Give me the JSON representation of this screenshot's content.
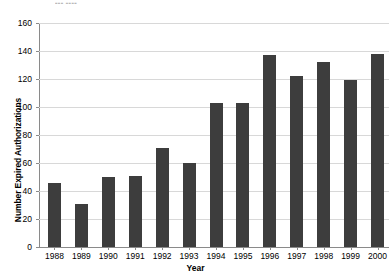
{
  "chart_data": {
    "type": "bar",
    "title": "",
    "title_remnant": "▪▪▪ ▪▪▪▪",
    "xlabel": "Year",
    "ylabel": "Number Expired Authorizations",
    "categories": [
      "1988",
      "1989",
      "1990",
      "1991",
      "1992",
      "1993",
      "1994",
      "1995",
      "1996",
      "1997",
      "1998",
      "1999",
      "2000"
    ],
    "values": [
      46,
      31,
      50,
      51,
      71,
      60,
      103,
      103,
      137,
      122,
      132,
      119,
      138
    ],
    "series": [
      {
        "name": "Number Expired Authorizations",
        "values": [
          46,
          31,
          50,
          51,
          71,
          60,
          103,
          103,
          137,
          122,
          132,
          119,
          138
        ]
      }
    ],
    "ylim": [
      0,
      160
    ],
    "ytick_values": [
      0,
      20,
      40,
      60,
      80,
      100,
      120,
      140,
      160
    ],
    "ytick_labels": [
      "0",
      "20",
      "40",
      "60",
      "80",
      "100",
      "120",
      "140",
      "160"
    ],
    "grid": true,
    "grid_axis": "y",
    "legend": false,
    "bar_color": "#3d3d3d",
    "grid_color": "#d8d8d8",
    "axis_color": "#8a8a8a"
  },
  "axes": {
    "y_title": "Number Expired Authorizations",
    "x_title": "Year"
  }
}
